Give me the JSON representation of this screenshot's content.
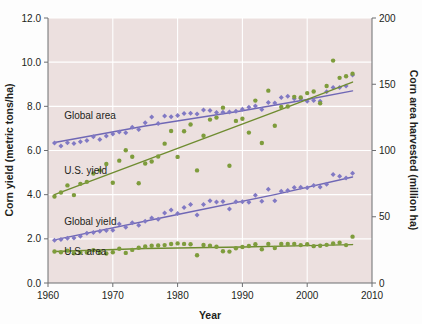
{
  "chart_data": {
    "type": "scatter",
    "title": "",
    "subtitle": "",
    "xlabel": "Year",
    "ylabel": "Corn yield (metric tons/ha)",
    "y2label": "Corn area harvested (million ha)",
    "xlim": [
      1960,
      2010
    ],
    "ylim": [
      0.0,
      12.0
    ],
    "y2lim": [
      0,
      200
    ],
    "xticks": [
      "1960",
      "1970",
      "1980",
      "1990",
      "2000",
      "2010"
    ],
    "xtick_values": [
      1960,
      1970,
      1980,
      1990,
      2000,
      2010
    ],
    "yticks": [
      "0.0",
      "2.0",
      "4.0",
      "6.0",
      "8.0",
      "10.0",
      "12.0"
    ],
    "ytick_values": [
      0.0,
      2.0,
      4.0,
      6.0,
      8.0,
      10.0,
      12.0
    ],
    "y2ticks": [
      "0",
      "50",
      "100",
      "150",
      "200"
    ],
    "y2tick_values": [
      0,
      50,
      100,
      150,
      200
    ],
    "grid": true,
    "grid_color": "#ffffff",
    "plot_background": "#ece0df",
    "legend_position": "inline-annotations",
    "colors": {
      "purple": "#8179c4",
      "purple_line": "#6f67b5",
      "green": "#7e9c3c",
      "green_line": "#6f8c30",
      "text": "#231f20",
      "background": "#ece0df",
      "grid": "#ffffff",
      "axis": "#6d6e71"
    },
    "series": [
      {
        "name": "Global area",
        "label": "Global area",
        "color": "#8179c4",
        "axis": "right",
        "units": "million ha",
        "marker": "diamond",
        "label_x": 1962.5,
        "label_y_right": 124,
        "x": [
          1961,
          1962,
          1963,
          1964,
          1965,
          1966,
          1967,
          1968,
          1969,
          1970,
          1971,
          1972,
          1973,
          1974,
          1975,
          1976,
          1977,
          1978,
          1979,
          1980,
          1981,
          1982,
          1983,
          1984,
          1985,
          1986,
          1987,
          1988,
          1989,
          1990,
          1991,
          1992,
          1993,
          1994,
          1995,
          1996,
          1997,
          1998,
          1999,
          2000,
          2001,
          2002,
          2003,
          2004,
          2005,
          2006,
          2007
        ],
        "y": [
          105.6,
          103.4,
          105.9,
          105.2,
          106.6,
          107.6,
          110.3,
          108.3,
          110.9,
          112.4,
          114.0,
          113.4,
          117.6,
          115.9,
          121.0,
          125.2,
          120.3,
          126.0,
          125.4,
          126.5,
          128.0,
          128.1,
          127.5,
          130.6,
          130.2,
          128.6,
          128.8,
          129.1,
          129.6,
          131.1,
          132.6,
          133.5,
          131.0,
          136.3,
          135.9,
          140.0,
          141.0,
          139.1,
          139.3,
          137.1,
          137.8,
          137.2,
          144.4,
          147.5,
          147.5,
          148.6,
          157.0
        ],
        "trend": [
          {
            "x": 1961,
            "y": 106.0
          },
          {
            "x": 1975,
            "y": 118.5
          },
          {
            "x": 1990,
            "y": 130.0
          },
          {
            "x": 2000,
            "y": 138.5
          },
          {
            "x": 2007,
            "y": 145.0
          }
        ]
      },
      {
        "name": "U.S. yield",
        "label": "U.S. yield",
        "color": "#7e9c3c",
        "axis": "left",
        "units": "metric tons/ha",
        "marker": "circle",
        "label_x": 1962.5,
        "label_y_left": 4.95,
        "x": [
          1961,
          1962,
          1963,
          1964,
          1965,
          1966,
          1967,
          1968,
          1969,
          1970,
          1971,
          1972,
          1973,
          1974,
          1975,
          1976,
          1977,
          1978,
          1979,
          1980,
          1981,
          1982,
          1983,
          1984,
          1985,
          1986,
          1987,
          1988,
          1989,
          1990,
          1991,
          1992,
          1993,
          1994,
          1995,
          1996,
          1997,
          1998,
          1999,
          2000,
          2001,
          2002,
          2003,
          2004,
          2005,
          2006,
          2007
        ],
        "y": [
          3.92,
          4.1,
          4.42,
          3.98,
          4.49,
          4.58,
          4.96,
          5.1,
          5.39,
          4.54,
          5.54,
          6.01,
          5.72,
          4.52,
          5.41,
          5.5,
          5.73,
          6.31,
          6.88,
          5.71,
          6.87,
          7.18,
          5.1,
          6.67,
          7.4,
          7.49,
          7.94,
          5.31,
          7.34,
          7.44,
          6.81,
          8.26,
          6.34,
          8.71,
          7.12,
          7.97,
          7.99,
          8.43,
          8.4,
          8.6,
          8.67,
          8.14,
          8.92,
          10.07,
          9.29,
          9.36,
          9.48
        ],
        "trend": [
          {
            "x": 1961,
            "y": 4.0
          },
          {
            "x": 1980,
            "y": 6.1
          },
          {
            "x": 1995,
            "y": 7.75
          },
          {
            "x": 2007,
            "y": 9.1
          }
        ]
      },
      {
        "name": "Global yield",
        "label": "Global yield",
        "color": "#8179c4",
        "axis": "left",
        "units": "metric tons/ha",
        "marker": "diamond",
        "label_x": 1962.5,
        "label_y_left": 2.62,
        "x": [
          1961,
          1962,
          1963,
          1964,
          1965,
          1966,
          1967,
          1968,
          1969,
          1970,
          1971,
          1972,
          1973,
          1974,
          1975,
          1976,
          1977,
          1978,
          1979,
          1980,
          1981,
          1982,
          1983,
          1984,
          1985,
          1986,
          1987,
          1988,
          1989,
          1990,
          1991,
          1992,
          1993,
          1994,
          1995,
          1996,
          1997,
          1998,
          1999,
          2000,
          2001,
          2002,
          2003,
          2004,
          2005,
          2006,
          2007
        ],
        "y": [
          1.94,
          1.97,
          2.03,
          2.04,
          2.12,
          2.25,
          2.29,
          2.34,
          2.38,
          2.39,
          2.67,
          2.52,
          2.73,
          2.62,
          2.8,
          2.94,
          2.89,
          3.17,
          3.31,
          3.15,
          3.42,
          3.56,
          3.08,
          3.55,
          3.73,
          3.67,
          3.69,
          3.35,
          3.68,
          3.68,
          3.66,
          3.97,
          3.7,
          4.24,
          3.73,
          4.16,
          4.19,
          4.32,
          4.34,
          4.31,
          4.42,
          4.35,
          4.47,
          4.91,
          4.83,
          4.75,
          4.97
        ],
        "trend": [
          {
            "x": 1961,
            "y": 1.95
          },
          {
            "x": 1980,
            "y": 3.1
          },
          {
            "x": 1995,
            "y": 4.0
          },
          {
            "x": 2007,
            "y": 4.8
          }
        ]
      },
      {
        "name": "U.S. area",
        "label": "U.S. area",
        "color": "#7e9c3c",
        "axis": "right",
        "units": "million ha",
        "marker": "circle",
        "label_x": 1962.5,
        "label_y_right": 21,
        "x": [
          1961,
          1962,
          1963,
          1964,
          1965,
          1966,
          1967,
          1968,
          1969,
          1970,
          1971,
          1972,
          1973,
          1974,
          1975,
          1976,
          1977,
          1978,
          1979,
          1980,
          1981,
          1982,
          1983,
          1984,
          1985,
          1986,
          1987,
          1988,
          1989,
          1990,
          1991,
          1992,
          1993,
          1994,
          1995,
          1996,
          1997,
          1998,
          1999,
          2000,
          2001,
          2002,
          2003,
          2004,
          2005,
          2006,
          2007
        ],
        "y": [
          23.8,
          23.2,
          24.4,
          22.5,
          22.9,
          23.0,
          24.8,
          22.8,
          22.3,
          23.2,
          25.9,
          22.7,
          25.0,
          26.6,
          27.5,
          28.1,
          28.3,
          28.6,
          29.4,
          29.9,
          29.5,
          29.2,
          20.9,
          28.7,
          28.2,
          27.4,
          24.0,
          23.7,
          26.2,
          27.2,
          27.9,
          29.2,
          25.5,
          29.5,
          26.4,
          29.4,
          29.4,
          29.4,
          28.6,
          29.3,
          27.8,
          28.1,
          28.8,
          29.8,
          30.4,
          28.6,
          35.0
        ],
        "trend": [
          {
            "x": 1961,
            "y": 23.8
          },
          {
            "x": 1975,
            "y": 26.0
          },
          {
            "x": 1990,
            "y": 27.2
          },
          {
            "x": 2000,
            "y": 28.2
          },
          {
            "x": 2007,
            "y": 29.0
          }
        ]
      }
    ]
  },
  "axes": {
    "x_title": "Year",
    "y_left_title": "Corn yield (metric tons/ha)",
    "y_right_title": "Corn area harvested (million ha)"
  }
}
